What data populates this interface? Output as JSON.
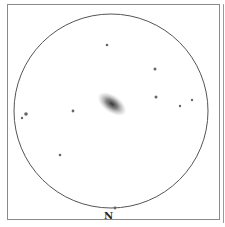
{
  "chart": {
    "title": "",
    "orientation_label": "N",
    "field_circle": {
      "cx": 111,
      "cy": 111,
      "r": 97,
      "color": "#555555"
    },
    "galaxy": {
      "cx": 112,
      "cy": 104,
      "rx": 17,
      "ry": 9,
      "angle": 35,
      "color": "#333333"
    },
    "stars": [
      {
        "x": 107,
        "y": 45,
        "r": 1.3
      },
      {
        "x": 155,
        "y": 69,
        "r": 1.5
      },
      {
        "x": 156,
        "y": 97,
        "r": 1.5
      },
      {
        "x": 180,
        "y": 106,
        "r": 1.2
      },
      {
        "x": 192,
        "y": 100,
        "r": 1.2
      },
      {
        "x": 73,
        "y": 111,
        "r": 1.4
      },
      {
        "x": 26,
        "y": 114,
        "r": 1.8
      },
      {
        "x": 22,
        "y": 118,
        "r": 1.2
      },
      {
        "x": 60,
        "y": 155,
        "r": 1.3
      },
      {
        "x": 115,
        "y": 208,
        "r": 1.4
      }
    ]
  }
}
